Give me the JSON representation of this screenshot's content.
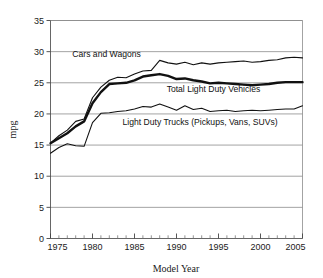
{
  "chart_data": {
    "type": "line",
    "title": "",
    "xlabel": "Model Year",
    "ylabel": "mpg",
    "xlim": [
      1975,
      2005
    ],
    "ylim": [
      0,
      35
    ],
    "grid": true,
    "legend_position": "inline-annotations",
    "x_major_ticks": [
      1975,
      1980,
      1985,
      1990,
      1995,
      2000,
      2005
    ],
    "x_major_tick_labels": [
      "1975",
      "1980",
      "1985",
      "1990",
      "1995",
      "2000",
      "2005"
    ],
    "x_minor_tick_step": 1,
    "y_ticks": [
      0,
      5,
      10,
      15,
      20,
      25,
      30,
      35
    ],
    "y_tick_labels": [
      "0",
      "5",
      "10",
      "15",
      "20",
      "25",
      "30",
      "35"
    ],
    "x": [
      1975,
      1976,
      1977,
      1978,
      1979,
      1980,
      1981,
      1982,
      1983,
      1984,
      1985,
      1986,
      1987,
      1988,
      1989,
      1990,
      1991,
      1992,
      1993,
      1994,
      1995,
      1996,
      1997,
      1998,
      1999,
      2000,
      2001,
      2002,
      2003,
      2004,
      2005
    ],
    "series": [
      {
        "name": "Cars and Wagons",
        "label": "Cars and Wagons",
        "color": "#111111",
        "line_width": 1.1,
        "values": [
          15.3,
          16.5,
          17.4,
          18.8,
          19.2,
          22.6,
          24.3,
          25.4,
          25.9,
          25.8,
          26.4,
          26.9,
          27.0,
          28.6,
          28.2,
          28.0,
          28.3,
          27.9,
          28.2,
          28.0,
          28.2,
          28.3,
          28.4,
          28.5,
          28.3,
          28.4,
          28.6,
          28.7,
          29.0,
          29.1,
          29.0
        ]
      },
      {
        "name": "Total Light Duty Vehicles",
        "label": "Total Light Duty Vehicles",
        "color": "#111111",
        "line_width": 2.4,
        "values": [
          15.3,
          16.1,
          16.9,
          18.0,
          18.8,
          21.7,
          23.5,
          24.8,
          24.9,
          25.0,
          25.4,
          26.0,
          26.2,
          26.4,
          26.1,
          25.6,
          25.7,
          25.4,
          25.2,
          24.9,
          25.0,
          24.9,
          24.8,
          24.7,
          24.6,
          24.7,
          24.8,
          25.0,
          25.1,
          25.1,
          25.1
        ]
      },
      {
        "name": "Light Duty Trucks (Pickups, Vans, SUVs)",
        "label": "Light Duty Trucks (Pickups, Vans, SUVs)",
        "color": "#111111",
        "line_width": 1.1,
        "values": [
          13.7,
          14.6,
          15.2,
          14.9,
          14.8,
          18.6,
          20.1,
          20.2,
          20.4,
          20.5,
          20.8,
          21.2,
          21.1,
          21.6,
          21.1,
          20.6,
          21.3,
          20.7,
          20.9,
          20.4,
          20.5,
          20.6,
          20.4,
          20.5,
          20.6,
          20.5,
          20.6,
          20.7,
          20.8,
          20.8,
          21.3
        ]
      }
    ],
    "annotations": [
      {
        "text": "Cars and Wagons",
        "x": 1977.6,
        "y": 29.2,
        "anchor": "start"
      },
      {
        "text": "Total Light Duty Vehicles",
        "x": 1994.4,
        "y": 23.6,
        "anchor": "middle"
      },
      {
        "text": "Light Duty Trucks (Pickups, Vans, SUVs)",
        "x": 1992.8,
        "y": 18.3,
        "anchor": "middle"
      }
    ]
  }
}
